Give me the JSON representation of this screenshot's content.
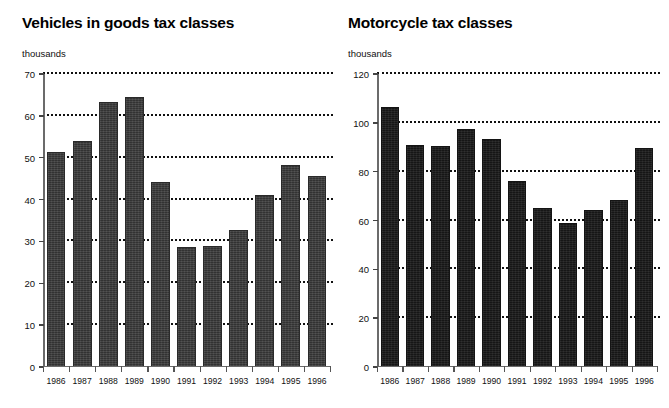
{
  "page": {
    "background_color": "#ffffff",
    "bar_color_left": "#3b3b3b",
    "bar_color_right": "#1b1b1b",
    "axis_color": "#6b6b6b",
    "gridline_color": "#111111"
  },
  "charts": [
    {
      "id": "vehicles-goods-tax-classes",
      "title": "Vehicles in goods tax classes",
      "unit_label": "thousands"
    },
    {
      "id": "motorcycle-tax-classes",
      "title": "Motorcycle tax classes",
      "unit_label": "thousands"
    }
  ],
  "chart_data": [
    {
      "type": "bar",
      "title": "Vehicles in goods tax classes",
      "xlabel": "",
      "ylabel": "thousands",
      "ylim": [
        0,
        70
      ],
      "yticks": [
        0,
        10,
        20,
        30,
        40,
        50,
        60,
        70
      ],
      "gridlines": [
        10,
        20,
        30,
        40,
        50,
        60,
        70
      ],
      "grid": true,
      "legend": "none",
      "categories": [
        "1986",
        "1987",
        "1988",
        "1989",
        "1990",
        "1991",
        "1992",
        "1993",
        "1994",
        "1995",
        "1996"
      ],
      "values": [
        51.3,
        54.0,
        63.2,
        64.4,
        44.3,
        28.6,
        29.0,
        32.8,
        41.0,
        48.2,
        45.6
      ]
    },
    {
      "type": "bar",
      "title": "Motorcycle tax classes",
      "xlabel": "",
      "ylabel": "thousands",
      "ylim": [
        0,
        120
      ],
      "yticks": [
        0,
        20,
        40,
        60,
        80,
        100,
        120
      ],
      "gridlines": [
        20,
        40,
        60,
        80,
        100,
        120
      ],
      "grid": true,
      "legend": "none",
      "categories": [
        "1986",
        "1987",
        "1988",
        "1989",
        "1990",
        "1991",
        "1992",
        "1993",
        "1994",
        "1995",
        "1996"
      ],
      "values": [
        106.5,
        91.0,
        90.5,
        97.5,
        93.5,
        76.0,
        65.0,
        59.0,
        64.5,
        68.5,
        89.5
      ]
    }
  ]
}
